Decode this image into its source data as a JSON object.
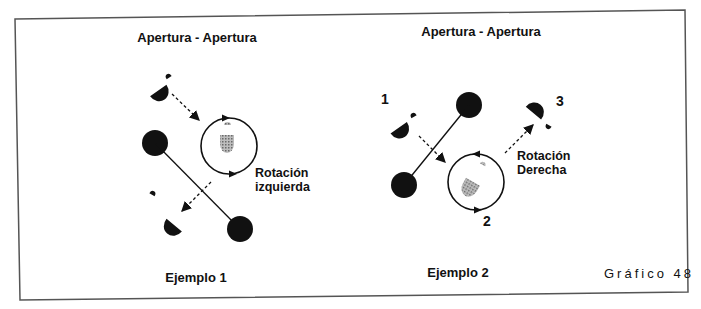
{
  "figure": {
    "caption": "Gráfico 48"
  },
  "panels": [
    {
      "title": "Apertura - Apertura",
      "rotation_label_line1": "Rotación",
      "rotation_label_line2": "izquierda",
      "example_label": "Ejemplo 1"
    },
    {
      "title": "Apertura - Apertura",
      "rotation_label_line1": "Rotación",
      "rotation_label_line2": "Derecha",
      "example_label": "Ejemplo 2",
      "step_labels": [
        "1",
        "2",
        "3"
      ]
    }
  ],
  "colors": {
    "ink": "#111111",
    "shaded": "#8a8a8a",
    "border": "#555555",
    "background": "#ffffff"
  },
  "icons": {
    "player": "player-shape-icon",
    "ball": "ball-icon",
    "rotation_circle": "rotation-circle-icon",
    "move_arrow": "dashed-arrow-icon"
  }
}
